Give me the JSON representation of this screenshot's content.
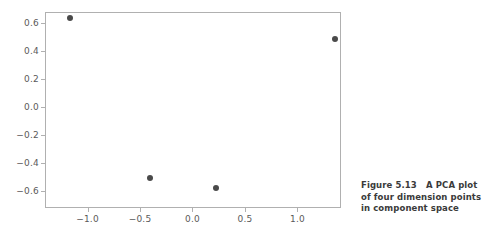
{
  "figure": {
    "caption_lines": [
      "Figure 5.13   A PCA plot",
      "of four dimension points",
      "in component space"
    ],
    "caption_full": "Figure 5.13   A PCA plot of four dimension points in component space",
    "figure_number": "5.13",
    "marker_color": "#4a4a4a",
    "axis_color": "#b0b0b0",
    "tick_label_color": "#5a5a5a",
    "background_color": "#ffffff"
  },
  "chart_data": {
    "type": "scatter",
    "title": "",
    "xlabel": "",
    "ylabel": "",
    "xlim": [
      -1.405,
      1.415
    ],
    "ylim": [
      -0.725,
      0.675
    ],
    "grid": false,
    "legend": null,
    "xticks": [
      -1.0,
      -0.5,
      0.0,
      0.5,
      1.0
    ],
    "xtick_labels": [
      "−1.0",
      "−0.5",
      "0.0",
      "0.5",
      "1.0"
    ],
    "yticks": [
      0.6,
      0.4,
      0.2,
      0.0,
      -0.2,
      -0.4,
      -0.6
    ],
    "ytick_labels": [
      "0.6",
      "0.4",
      "0.2",
      "0.0",
      "−0.2",
      "−0.4",
      "−0.6"
    ],
    "series": [
      {
        "name": "dimension points",
        "marker": "circle",
        "color": "#4a4a4a",
        "points": [
          {
            "x": -1.17,
            "y": 0.63
          },
          {
            "x": 1.36,
            "y": 0.485
          },
          {
            "x": -0.4,
            "y": -0.51
          },
          {
            "x": 0.22,
            "y": -0.585
          }
        ]
      }
    ]
  }
}
